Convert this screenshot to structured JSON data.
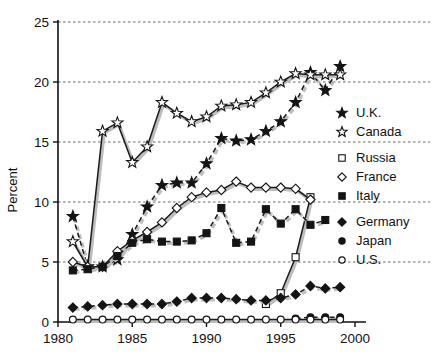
{
  "chart_data": {
    "type": "line",
    "title": "",
    "xlabel": "",
    "ylabel": "Percent",
    "xlim": [
      1980,
      2000
    ],
    "ylim": [
      0,
      25
    ],
    "xticks": [
      1980,
      1985,
      1990,
      1995,
      2000
    ],
    "yticks": [
      0,
      5,
      10,
      15,
      20,
      25
    ],
    "grid": true,
    "grid_axis": "y",
    "legend_position": "right",
    "series": [
      {
        "name": "U.K.",
        "marker": "star-filled",
        "linestyle": "dashed",
        "x": [
          1981,
          1982,
          1983,
          1984,
          1985,
          1986,
          1987,
          1988,
          1989,
          1990,
          1991,
          1992,
          1993,
          1994,
          1995,
          1996,
          1997,
          1998,
          1999
        ],
        "values": [
          8.8,
          4.6,
          4.6,
          5.2,
          7.3,
          9.6,
          11.4,
          11.6,
          11.6,
          13.2,
          15.3,
          15.1,
          15.2,
          15.9,
          16.7,
          18.3,
          20.8,
          19.3,
          21.3
        ]
      },
      {
        "name": "Canada",
        "marker": "star-open",
        "linestyle": "solid",
        "x": [
          1981,
          1982,
          1983,
          1984,
          1985,
          1986,
          1987,
          1988,
          1989,
          1990,
          1991,
          1992,
          1993,
          1994,
          1995,
          1996,
          1997,
          1998,
          1999
        ],
        "values": [
          6.7,
          4.6,
          15.9,
          16.6,
          13.3,
          14.6,
          18.3,
          17.4,
          16.7,
          17.1,
          18.0,
          18.1,
          18.3,
          19.1,
          20.0,
          20.7,
          20.6,
          20.6,
          20.6
        ]
      },
      {
        "name": "Russia",
        "marker": "square-open",
        "linestyle": "solid",
        "x": [
          1994,
          1995,
          1996,
          1997
        ],
        "values": [
          1.5,
          2.4,
          5.4,
          10.4
        ]
      },
      {
        "name": "France",
        "marker": "diamond-open",
        "linestyle": "solid",
        "x": [
          1981,
          1982,
          1983,
          1984,
          1985,
          1986,
          1987,
          1988,
          1989,
          1990,
          1991,
          1992,
          1993,
          1994,
          1995,
          1996,
          1997
        ],
        "values": [
          5.0,
          4.6,
          4.6,
          5.9,
          6.8,
          7.5,
          8.3,
          9.5,
          10.4,
          10.8,
          11.0,
          11.7,
          11.2,
          11.2,
          11.2,
          11.1,
          10.2
        ]
      },
      {
        "name": "Italy",
        "marker": "square-filled",
        "linestyle": "dashed",
        "x": [
          1981,
          1982,
          1983,
          1984,
          1985,
          1986,
          1987,
          1988,
          1989,
          1990,
          1991,
          1992,
          1993,
          1994,
          1995,
          1996,
          1997,
          1998
        ],
        "values": [
          4.3,
          4.4,
          4.6,
          5.5,
          6.6,
          6.9,
          6.7,
          6.7,
          6.8,
          7.4,
          9.5,
          6.6,
          6.7,
          9.4,
          8.2,
          9.4,
          8.1,
          8.5
        ]
      },
      {
        "name": "Germany",
        "marker": "diamond-filled",
        "linestyle": "dashed",
        "x": [
          1981,
          1982,
          1983,
          1984,
          1985,
          1986,
          1987,
          1988,
          1989,
          1990,
          1991,
          1992,
          1993,
          1994,
          1995,
          1996,
          1997,
          1998,
          1999
        ],
        "values": [
          1.2,
          1.3,
          1.4,
          1.5,
          1.5,
          1.5,
          1.5,
          1.7,
          2.0,
          2.0,
          2.0,
          1.9,
          1.8,
          1.8,
          2.0,
          2.3,
          3.0,
          2.8,
          2.9
        ]
      },
      {
        "name": "Japan",
        "marker": "circle-filled",
        "linestyle": "dashed",
        "x": [
          1996,
          1997,
          1998,
          1999
        ],
        "values": [
          0.3,
          0.4,
          0.4,
          0.4
        ]
      },
      {
        "name": "U.S.",
        "marker": "circle-open",
        "linestyle": "solid",
        "x": [
          1981,
          1982,
          1983,
          1984,
          1985,
          1986,
          1987,
          1988,
          1989,
          1990,
          1991,
          1992,
          1993,
          1994,
          1995,
          1996,
          1997,
          1998,
          1999
        ],
        "values": [
          0.2,
          0.2,
          0.2,
          0.2,
          0.2,
          0.2,
          0.2,
          0.2,
          0.2,
          0.2,
          0.2,
          0.2,
          0.2,
          0.2,
          0.2,
          0.2,
          0.2,
          0.2,
          0.2
        ]
      }
    ]
  },
  "legend": {
    "groups": [
      {
        "items": [
          "U.K.",
          "Canada"
        ]
      },
      {
        "items": [
          "Russia",
          "France",
          "Italy"
        ]
      },
      {
        "items": [
          "Germany",
          "Japan",
          "U.S."
        ]
      }
    ]
  },
  "axis": {
    "ylabel": "Percent",
    "xtick_labels": [
      "1980",
      "1985",
      "1990",
      "1995",
      "2000"
    ],
    "ytick_labels": [
      "0",
      "5",
      "10",
      "15",
      "20",
      "25"
    ]
  },
  "colors": {
    "line": "#1a1a1a",
    "shadow": "#bdbdbd",
    "grid": "#555555",
    "text": "#111111",
    "background": "#ffffff"
  }
}
